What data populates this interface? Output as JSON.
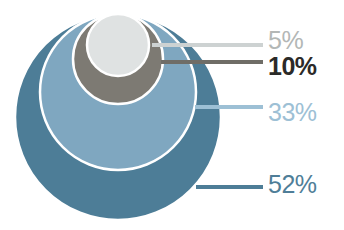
{
  "chart_data": {
    "type": "pie",
    "variant": "nested-top-tangent-circles",
    "title": "",
    "subtitle": "",
    "xlabel": "",
    "ylabel": "",
    "grid": false,
    "legend": "right-leader-lines",
    "total": 100,
    "unit": "%",
    "categories": [
      "5%",
      "10%",
      "33%",
      "52%"
    ],
    "values": [
      5,
      10,
      33,
      52
    ],
    "labels": [
      "5%",
      "10%",
      "33%",
      "52%"
    ],
    "series": [
      {
        "name": "share",
        "values": [
          5,
          10,
          33,
          52
        ]
      }
    ],
    "slices": [
      {
        "label": "5%",
        "value": 5,
        "fill": "#dfe2e2",
        "text_color": "#b3b7b6",
        "leader_color": "#cdd2d2",
        "bold": false,
        "cx": 118,
        "cy": 45,
        "r": 31,
        "label_x": 268,
        "label_y": 42,
        "leader_x1": 152,
        "leader_y1": 45,
        "leader_x2": 263,
        "leader_y2": 45
      },
      {
        "label": "10%",
        "value": 10,
        "fill": "#7d7a73",
        "text_color": "#2b2a28",
        "leader_color": "#6f6d67",
        "bold": true,
        "cx": 118,
        "cy": 59,
        "r": 45,
        "label_x": 268,
        "label_y": 68,
        "leader_x1": 161,
        "leader_y1": 62,
        "leader_x2": 263,
        "leader_y2": 62
      },
      {
        "label": "33%",
        "value": 33,
        "fill": "#7fa7c0",
        "text_color": "#9dc0d5",
        "leader_color": "#9dc0d5",
        "bold": false,
        "cx": 118,
        "cy": 92,
        "r": 78,
        "label_x": 268,
        "label_y": 114,
        "leader_x1": 195,
        "leader_y1": 107,
        "leader_x2": 263,
        "leader_y2": 107
      },
      {
        "label": "52%",
        "value": 52,
        "fill": "#4d7d97",
        "text_color": "#4f7e98",
        "leader_color": "#4d7d97",
        "bold": false,
        "cx": 118,
        "cy": 117,
        "r": 103,
        "label_x": 268,
        "label_y": 186,
        "leader_x1": 196,
        "leader_y1": 187,
        "leader_x2": 263,
        "leader_y2": 187
      }
    ],
    "stroke": {
      "color": "#ffffff",
      "width": 2.5
    },
    "background": "#ffffff"
  }
}
